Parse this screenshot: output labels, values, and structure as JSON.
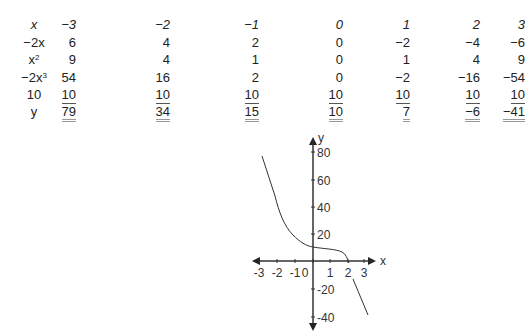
{
  "table": {
    "row_labels": [
      "x",
      "−2x",
      "x2",
      "−2x3",
      "10",
      "y"
    ],
    "x_values": [
      "−3",
      "−2",
      "−1",
      "0",
      "1",
      "2",
      "3"
    ],
    "rows": {
      "neg2x": [
        "6",
        "4",
        "2",
        "0",
        "−2",
        "−4",
        "−6"
      ],
      "x2": [
        "9",
        "4",
        "1",
        "0",
        "1",
        "4",
        "9"
      ],
      "neg2x3": [
        "54",
        "16",
        "2",
        "0",
        "−2",
        "−16",
        "−54"
      ],
      "const10": [
        "10",
        "10",
        "10",
        "10",
        "10",
        "10",
        "10"
      ],
      "y": [
        "79",
        "34",
        "15",
        "10",
        "7",
        "−6",
        "−41"
      ]
    }
  },
  "chart_data": {
    "type": "line",
    "title": "",
    "function": "y = -2x^3 + x^2 - 2x + 10",
    "x": [
      -3,
      -2,
      -1,
      0,
      1,
      2,
      3
    ],
    "series": [
      {
        "name": "y",
        "values": [
          79,
          34,
          15,
          10,
          7,
          -6,
          -41
        ]
      }
    ],
    "xlabel": "x",
    "ylabel": "y",
    "x_ticks": [
      "-3",
      "-2",
      "-1",
      "0",
      "1",
      "2",
      "3"
    ],
    "y_ticks": [
      "80",
      "60",
      "40",
      "20",
      "-20",
      "-40"
    ],
    "xlim": [
      -3.5,
      3.5
    ],
    "ylim": [
      -45,
      85
    ],
    "grid": false,
    "legend": "none"
  },
  "graph": {
    "x_label": "x",
    "y_label": "y",
    "x_tick_labels": [
      "-3",
      "-2",
      "-1",
      "0",
      "1",
      "2",
      "3"
    ],
    "y_tick_labels": [
      "80",
      "60",
      "40",
      "20",
      "-20",
      "-40"
    ]
  }
}
